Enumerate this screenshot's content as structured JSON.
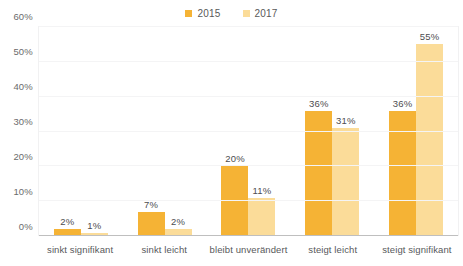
{
  "chart_data": {
    "type": "bar",
    "title": "",
    "xlabel": "",
    "ylabel": "",
    "ylim": [
      0,
      60
    ],
    "ytick_values": [
      60,
      50,
      40,
      30,
      20,
      10,
      0
    ],
    "ytick_labels": [
      "60%",
      "50%",
      "40%",
      "30%",
      "20%",
      "10%",
      "0%"
    ],
    "grid": true,
    "legend_position": "top-center",
    "categories": [
      "sinkt signifikant",
      "sinkt leicht",
      "bleibt unverändert",
      "steigt leicht",
      "steigt signifikant"
    ],
    "series": [
      {
        "name": "2015",
        "color": "#F5B335",
        "values": [
          2,
          7,
          20,
          36,
          36
        ],
        "labels": [
          "2%",
          "7%",
          "20%",
          "36%",
          "36%"
        ]
      },
      {
        "name": "2017",
        "color": "#FBDC99",
        "values": [
          1,
          2,
          11,
          31,
          55
        ],
        "labels": [
          "1%",
          "2%",
          "11%",
          "31%",
          "55%"
        ]
      }
    ]
  },
  "legend": {
    "items": [
      {
        "label": "2015",
        "color": "#F5B335"
      },
      {
        "label": "2017",
        "color": "#FBDC99"
      }
    ]
  },
  "colors": {
    "series_2015": "#F5B335",
    "series_2017": "#FBDC99",
    "gridline": "#F4F4F5",
    "axis_line": "#BFBFBF",
    "text": "#58595B",
    "background": "#FFFFFF"
  }
}
